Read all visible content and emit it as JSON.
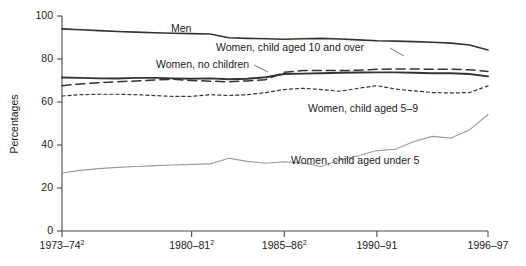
{
  "chart_data": {
    "type": "line",
    "title": "",
    "xlabel": "",
    "ylabel": "Percentages",
    "ylim": [
      0,
      100
    ],
    "ytick_values": [
      0,
      20,
      40,
      60,
      80,
      100
    ],
    "ytick_labels": [
      "0",
      "20",
      "40",
      "60",
      "80",
      "100"
    ],
    "grid": false,
    "legend_position": "inline-annotations",
    "x": [
      "1973-74",
      "1974-75",
      "1975-76",
      "1976-77",
      "1977-78",
      "1978-79",
      "1979-80",
      "1980-81",
      "1981-82",
      "1982-83",
      "1983-84",
      "1984-85",
      "1985-86",
      "1986-87",
      "1987-88",
      "1988-89",
      "1989-90",
      "1990-91",
      "1991-92",
      "1992-93",
      "1993-94",
      "1994-95",
      "1995-96",
      "1996-97"
    ],
    "xtick_labels": [
      {
        "label": "1973–74",
        "superscript": "2",
        "x_value": "1973-74"
      },
      {
        "label": "1980–81",
        "superscript": "2",
        "x_value": "1980-81"
      },
      {
        "label": "1985–86",
        "superscript": "2",
        "x_value": "1985-86"
      },
      {
        "label": "1990–91",
        "superscript": "",
        "x_value": "1990-91"
      },
      {
        "label": "1996–97",
        "superscript": "",
        "x_value": "1996-97"
      }
    ],
    "series": [
      {
        "name": "Men",
        "style": "solid",
        "color": "#333333",
        "width": 1.6,
        "values": [
          94,
          93.6,
          93.2,
          92.8,
          92.5,
          92.2,
          92.0,
          91.8,
          91.6,
          89.9,
          89.6,
          89.4,
          89.2,
          89.4,
          89.6,
          89.3,
          88.9,
          88.5,
          88.3,
          88.1,
          87.8,
          87.4,
          86.5,
          84.2
        ]
      },
      {
        "name": "Women, child aged 10 and over",
        "style": "solid",
        "color": "#333333",
        "width": 1.9,
        "values": [
          71.4,
          71.2,
          71.0,
          70.9,
          71.2,
          71.2,
          71.0,
          70.8,
          71.0,
          70.6,
          70.8,
          71.5,
          73.0,
          73.2,
          73.4,
          73.6,
          73.7,
          73.8,
          73.8,
          73.6,
          73.4,
          73.4,
          73.0,
          71.9
        ]
      },
      {
        "name": "Women, no children",
        "style": "dashed",
        "color": "#333333",
        "width": 1.5,
        "values": [
          67.6,
          68.4,
          69.0,
          69.4,
          69.8,
          70.2,
          70.6,
          70.0,
          69.7,
          69.4,
          69.8,
          70.4,
          73.8,
          74.6,
          74.6,
          74.6,
          74.8,
          75.2,
          75.4,
          75.4,
          75.2,
          75.2,
          75.0,
          74.2
        ]
      },
      {
        "name": "Women, child aged 5–9",
        "style": "dotted",
        "color": "#333333",
        "width": 1.2,
        "values": [
          62.8,
          63.4,
          63.6,
          63.6,
          63.4,
          63.0,
          62.6,
          62.6,
          63.4,
          63.0,
          63.4,
          64.4,
          65.8,
          66.4,
          65.8,
          65.0,
          66.4,
          67.6,
          66.0,
          65.2,
          64.4,
          64.2,
          64.4,
          67.5
        ]
      },
      {
        "name": "Women, child aged under 5",
        "style": "solid",
        "color": "#9a9a9a",
        "width": 1.1,
        "values": [
          27.0,
          28.2,
          29.0,
          29.6,
          30.0,
          30.4,
          30.7,
          31.0,
          31.2,
          33.8,
          32.4,
          31.5,
          32.2,
          31.6,
          30.0,
          33.0,
          35.0,
          37.4,
          38.0,
          41.6,
          44.0,
          43.2,
          47.0,
          54.2
        ]
      }
    ],
    "annotations": [
      {
        "text": "Men",
        "series": "Men",
        "leader": false
      },
      {
        "text": "Women, child aged 10 and over",
        "series": "Women, child aged 10 and over",
        "leader": true
      },
      {
        "text": "Women, no children",
        "series": "Women, no children",
        "leader": true
      },
      {
        "text": "Women, child aged 5–9",
        "series": "Women, child aged 5–9",
        "leader": false
      },
      {
        "text": "Women, child aged under 5",
        "series": "Women, child aged under 5",
        "leader": false
      }
    ]
  },
  "axis": {
    "y_title": "Percentages"
  }
}
